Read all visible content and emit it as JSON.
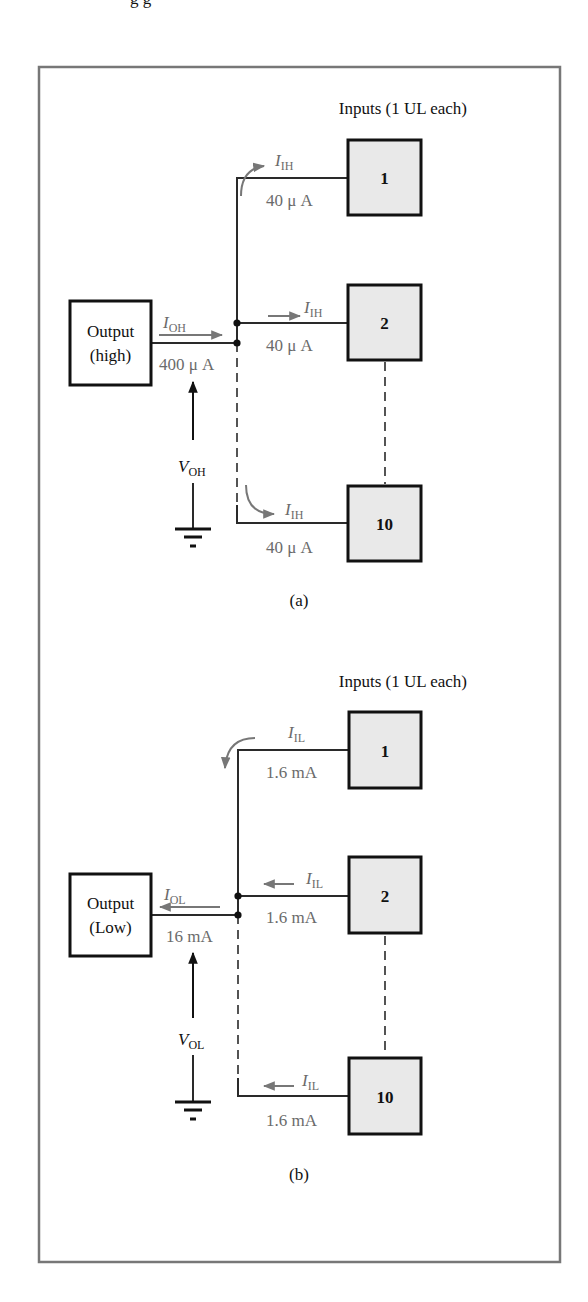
{
  "page": {
    "cut_text_top": "g g"
  },
  "colors": {
    "frame": "#777777",
    "wire": "#2a2a2a",
    "current_label": "#6b6b6b",
    "gate_fill": "#e9e9e9"
  },
  "figure_a": {
    "inputs_title": "Inputs (1 UL each)",
    "output_line1": "Output",
    "output_line2": "(high)",
    "source_current": {
      "symbol": "I",
      "subscript": "OH",
      "value": "400 μ A"
    },
    "voltage": {
      "symbol": "V",
      "subscript": "OH"
    },
    "gates": [
      {
        "label": "1",
        "current_symbol": "I",
        "current_subscript": "IH",
        "current_value": "40 μ A"
      },
      {
        "label": "2",
        "current_symbol": "I",
        "current_subscript": "IH",
        "current_value": "40 μ A"
      },
      {
        "label": "10",
        "current_symbol": "I",
        "current_subscript": "IH",
        "current_value": "40 μ A"
      }
    ],
    "caption": "(a)"
  },
  "figure_b": {
    "inputs_title": "Inputs (1 UL each)",
    "output_line1": "Output",
    "output_line2": "(Low)",
    "source_current": {
      "symbol": "I",
      "subscript": "OL",
      "value": "16 mA"
    },
    "voltage": {
      "symbol": "V",
      "subscript": "OL"
    },
    "gates": [
      {
        "label": "1",
        "current_symbol": "I",
        "current_subscript": "IL",
        "current_value": "1.6 mA"
      },
      {
        "label": "2",
        "current_symbol": "I",
        "current_subscript": "IL",
        "current_value": "1.6 mA"
      },
      {
        "label": "10",
        "current_symbol": "I",
        "current_subscript": "IL",
        "current_value": "1.6 mA"
      }
    ],
    "caption": "(b)"
  }
}
